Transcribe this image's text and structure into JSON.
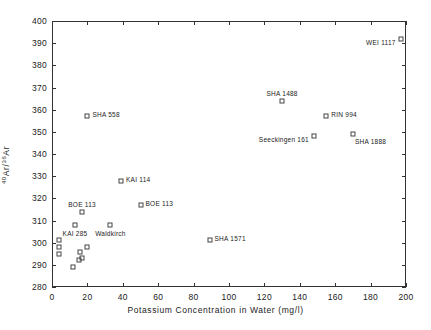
{
  "chart_data": {
    "type": "scatter",
    "title": "",
    "xlabel": "Potassium Concentration in Water (mg/l)",
    "ylabel_html": "40Ar/36Ar",
    "ylabel_base": "Ar/",
    "ylabel_sup1": "40",
    "ylabel_sup2": "36",
    "ylabel_tail": "Ar",
    "xlim": [
      0,
      200
    ],
    "ylim": [
      280,
      400
    ],
    "xticks": [
      0,
      20,
      40,
      60,
      80,
      100,
      120,
      140,
      160,
      180,
      200
    ],
    "yticks": [
      280,
      290,
      300,
      310,
      320,
      330,
      340,
      350,
      360,
      370,
      380,
      390,
      400
    ],
    "grid": false,
    "legend": "none",
    "marker": "open-square",
    "points": [
      {
        "x": 4,
        "y": 301,
        "label": "",
        "pos": "r"
      },
      {
        "x": 4,
        "y": 298,
        "label": "",
        "pos": "r"
      },
      {
        "x": 4,
        "y": 295,
        "label": "",
        "pos": "r"
      },
      {
        "x": 12,
        "y": 289,
        "label": "",
        "pos": "r"
      },
      {
        "x": 13,
        "y": 308,
        "label": "KAI 285",
        "pos": "below"
      },
      {
        "x": 15,
        "y": 292,
        "label": "",
        "pos": "r"
      },
      {
        "x": 16,
        "y": 296,
        "label": "",
        "pos": "r"
      },
      {
        "x": 17,
        "y": 293,
        "label": "",
        "pos": "r"
      },
      {
        "x": 17,
        "y": 314,
        "label": "BOE 113",
        "pos": "above"
      },
      {
        "x": 20,
        "y": 298,
        "label": "",
        "pos": "r"
      },
      {
        "x": 20,
        "y": 357,
        "label": "SHA 558",
        "pos": "r"
      },
      {
        "x": 33,
        "y": 308,
        "label": "Waldkirch",
        "pos": "below"
      },
      {
        "x": 39,
        "y": 328,
        "label": "KAI 114",
        "pos": "r"
      },
      {
        "x": 50,
        "y": 317,
        "label": "BOE 113",
        "pos": "r"
      },
      {
        "x": 89,
        "y": 301,
        "label": "SHA 1571",
        "pos": "r"
      },
      {
        "x": 130,
        "y": 364,
        "label": "SHA 1488",
        "pos": "above"
      },
      {
        "x": 148,
        "y": 348,
        "label": "Seeckingen 161",
        "pos": "l"
      },
      {
        "x": 155,
        "y": 357,
        "label": "RIN 994",
        "pos": "r"
      },
      {
        "x": 170,
        "y": 349,
        "label": "SHA 1888",
        "pos": "belowr"
      },
      {
        "x": 197,
        "y": 392,
        "label": "WEI 1117",
        "pos": "l"
      }
    ]
  }
}
